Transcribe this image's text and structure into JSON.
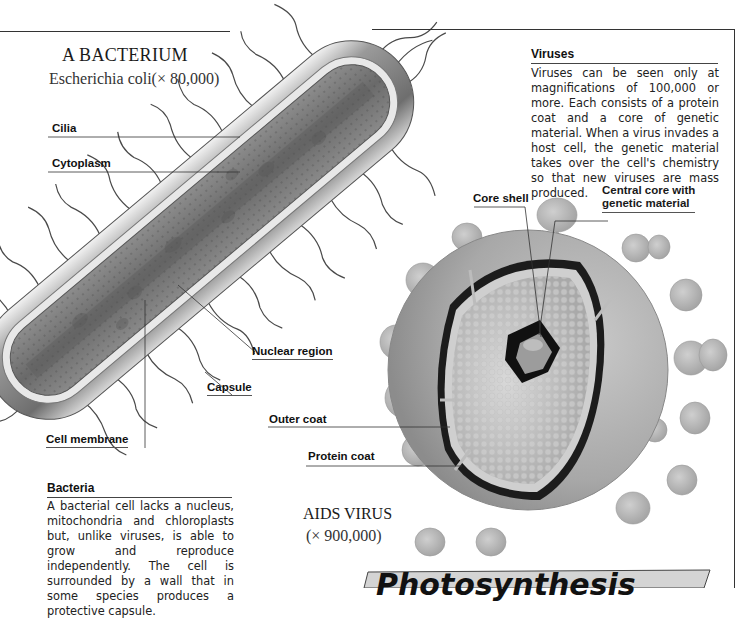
{
  "bacterium": {
    "title": "A BACTERIUM",
    "subtitle": "Escherichia coli(× 80,000)",
    "labels": {
      "cilia": "Cilia",
      "cytoplasm": "Cytoplasm",
      "nuclear_region": "Nuclear region",
      "capsule": "Capsule",
      "cell_membrane": "Cell membrane"
    }
  },
  "viruses_box": {
    "heading": "Viruses",
    "body": "Viruses can be seen only at magnifications of 100,000 or more. Each consists of a protein coat and a core of genetic material. When a virus invades a host cell, the genetic material takes over the cell's chemistry so that new viruses are mass produced."
  },
  "virus": {
    "title": "AIDS VIRUS",
    "subtitle": "(× 900,000)",
    "labels": {
      "core_shell": "Core shell",
      "central_core_line1": "Central core with",
      "central_core_line2": "genetic material",
      "outer_coat": "Outer coat",
      "protein_coat": "Protein coat"
    }
  },
  "bacteria_box": {
    "heading": "Bacteria",
    "body": "A bacterial cell lacks a nucleus, mitochondria and chloroplasts but, unlike viruses, is able to grow and reproduce independently. The cell is surrounded by a wall that in some species produces a protective capsule."
  },
  "next_section": {
    "title": "Photosynthesis"
  },
  "colors": {
    "banner_fill": "#d4d4d4",
    "virus_knob": "#b5b5b5",
    "capsule_gray": "#8a8a8a"
  }
}
